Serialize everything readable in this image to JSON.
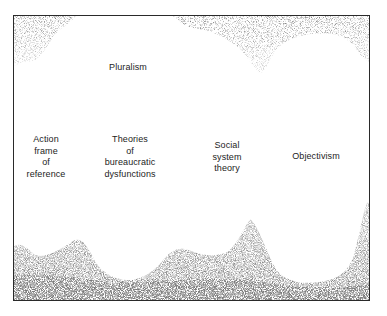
{
  "figure": {
    "type": "paradigm-map diagram (scanned, stippled texture)",
    "colors": {
      "border": "#2a2a2a",
      "stipple": "#3a3a3a",
      "background": "#ffffff",
      "text": "#1c1c1c"
    },
    "labels": {
      "pluralism": {
        "lines": [
          "Pluralism"
        ]
      },
      "action_frame": {
        "lines": [
          "Action",
          "frame",
          "of",
          "reference"
        ]
      },
      "bureaucratic": {
        "lines": [
          "Theories",
          "of",
          "bureaucratic",
          "dysfunctions"
        ]
      },
      "social_system": {
        "lines": [
          "Social",
          "system",
          "theory"
        ]
      },
      "objectivism": {
        "lines": [
          "Objectivism"
        ]
      }
    }
  }
}
